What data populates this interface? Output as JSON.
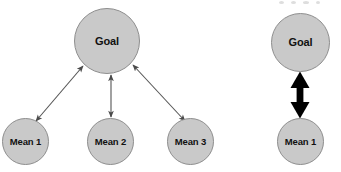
{
  "figure": {
    "background_color": "#ffffff",
    "node_fill": "#c9c9c9",
    "node_stroke": "#8e8e8e",
    "label_color": "#111111",
    "arrow_color_thin": "#555555",
    "arrow_color_thick": "#000000"
  },
  "diagrams": [
    {
      "id": "multiple-means",
      "goal": {
        "label": "Goal"
      },
      "means": [
        {
          "label": "Mean 1"
        },
        {
          "label": "Mean 2"
        },
        {
          "label": "Mean 3"
        }
      ],
      "edges": [
        {
          "from": "Mean 1",
          "to": "Goal",
          "style": "thin",
          "heads": "double"
        },
        {
          "from": "Mean 2",
          "to": "Goal",
          "style": "thin",
          "heads": "double"
        },
        {
          "from": "Mean 3",
          "to": "Goal",
          "style": "thin",
          "heads": "double"
        }
      ]
    },
    {
      "id": "single-mean",
      "goal": {
        "label": "Goal"
      },
      "means": [
        {
          "label": "Mean 1"
        }
      ],
      "edges": [
        {
          "from": "Mean 1",
          "to": "Goal",
          "style": "thick",
          "heads": "double"
        }
      ]
    }
  ]
}
